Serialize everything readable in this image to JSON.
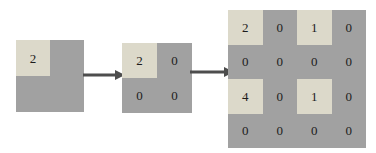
{
  "figure": {
    "step_count": 3
  },
  "grids": [
    {
      "name": "input-matrix-1x1",
      "rows": 2,
      "cols": 2,
      "cells": [
        [
          {
            "value": "2",
            "highlight": true
          },
          {
            "value": "",
            "highlight": false
          }
        ],
        [
          {
            "value": "",
            "highlight": false
          },
          {
            "value": "",
            "highlight": false
          }
        ]
      ]
    },
    {
      "name": "matrix-2x2",
      "rows": 2,
      "cols": 2,
      "cells": [
        [
          {
            "value": "2",
            "highlight": true
          },
          {
            "value": "0",
            "highlight": false
          }
        ],
        [
          {
            "value": "0",
            "highlight": false
          },
          {
            "value": "0",
            "highlight": false
          }
        ]
      ]
    },
    {
      "name": "matrix-4x4",
      "rows": 4,
      "cols": 4,
      "cells": [
        [
          {
            "value": "2",
            "highlight": true
          },
          {
            "value": "0",
            "highlight": false
          },
          {
            "value": "1",
            "highlight": true
          },
          {
            "value": "0",
            "highlight": false
          }
        ],
        [
          {
            "value": "0",
            "highlight": false
          },
          {
            "value": "0",
            "highlight": false
          },
          {
            "value": "0",
            "highlight": false
          },
          {
            "value": "0",
            "highlight": false
          }
        ],
        [
          {
            "value": "4",
            "highlight": true
          },
          {
            "value": "0",
            "highlight": false
          },
          {
            "value": "1",
            "highlight": true
          },
          {
            "value": "0",
            "highlight": false
          }
        ],
        [
          {
            "value": "0",
            "highlight": false
          },
          {
            "value": "0",
            "highlight": false
          },
          {
            "value": "0",
            "highlight": false
          },
          {
            "value": "0",
            "highlight": false
          }
        ]
      ]
    }
  ],
  "arrows": [
    {
      "name": "arrow-step-1",
      "direction": "right"
    },
    {
      "name": "arrow-step-2",
      "direction": "right"
    }
  ],
  "colors": {
    "background": "#ffffff",
    "cell_light": "#dcd9ca",
    "cell_dark": "#a1a1a1",
    "arrow": "#4d4d4d",
    "text": "#1c1c1c"
  }
}
